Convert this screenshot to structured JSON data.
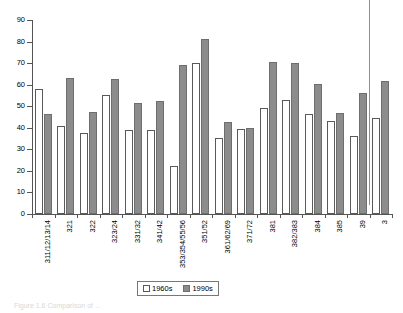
{
  "chart_data": {
    "type": "bar",
    "title": "",
    "xlabel": "",
    "ylabel": "",
    "ylim": [
      0,
      90
    ],
    "yticks": [
      0,
      10,
      20,
      30,
      40,
      50,
      60,
      70,
      80,
      90
    ],
    "grid": false,
    "legend_position": "bottom",
    "categories": [
      "311/12/13/14",
      "321",
      "322",
      "323/24",
      "331/32",
      "341/42",
      "353/354/55/56",
      "351/52",
      "361/62/69",
      "371/72",
      "381",
      "382/383",
      "384",
      "385",
      "39",
      "3"
    ],
    "series": [
      {
        "name": "1960s",
        "color": "#ffffff",
        "values": [
          57.8,
          41.0,
          37.8,
          55.4,
          38.8,
          39.2,
          22.5,
          70.2,
          35.1,
          39.5,
          49.2,
          52.7,
          46.5,
          43.3,
          36.1,
          44.6
        ]
      },
      {
        "name": "1990s",
        "color": "#8c8c8c",
        "values": [
          46.5,
          63.3,
          47.1,
          62.7,
          51.6,
          52.3,
          69.3,
          81.0,
          42.9,
          39.9,
          70.3,
          70.2,
          60.3,
          47.0,
          56.2,
          61.7
        ]
      }
    ]
  },
  "legend": {
    "items": [
      {
        "label": "1960s",
        "swatch": "white-square"
      },
      {
        "label": "1990s",
        "swatch": "gray-square"
      }
    ]
  },
  "caption": {
    "text": "Figure 1.6  Comparison of ..."
  }
}
